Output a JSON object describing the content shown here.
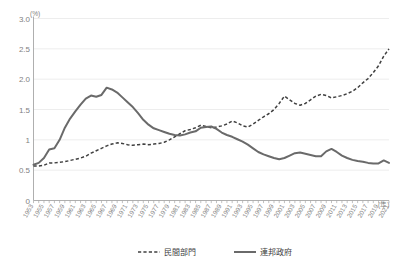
{
  "chart_data": {
    "type": "line",
    "title": "",
    "subtitle": "",
    "xlabel": "(年)",
    "ylabel": "(%)",
    "ylim": [
      0,
      3.0
    ],
    "xlim": [
      1953,
      2021
    ],
    "yticks": [
      "0",
      "0.5",
      "1",
      "1.5",
      "2.0",
      "2.5",
      "3.0"
    ],
    "ytick_values": [
      0,
      0.5,
      1,
      1.5,
      2.0,
      2.5,
      3.0
    ],
    "grid": true,
    "legend_position": "bottom-center",
    "x": [
      1953,
      1954,
      1955,
      1956,
      1957,
      1958,
      1959,
      1960,
      1961,
      1962,
      1963,
      1964,
      1965,
      1966,
      1967,
      1968,
      1969,
      1970,
      1971,
      1972,
      1973,
      1974,
      1975,
      1976,
      1977,
      1978,
      1979,
      1980,
      1981,
      1982,
      1983,
      1984,
      1985,
      1986,
      1987,
      1988,
      1989,
      1990,
      1991,
      1992,
      1993,
      1994,
      1995,
      1996,
      1997,
      1998,
      1999,
      2000,
      2001,
      2002,
      2003,
      2004,
      2005,
      2006,
      2007,
      2008,
      2009,
      2010,
      2011,
      2012,
      2013,
      2014,
      2015,
      2016,
      2017,
      2018,
      2019,
      2020,
      2021
    ],
    "xtick_labels": [
      "1953",
      "1955",
      "1957",
      "1959",
      "1961",
      "1963",
      "1965",
      "1967",
      "1969",
      "1971",
      "1973",
      "1975",
      "1977",
      "1979",
      "1981",
      "1983",
      "1985",
      "1987",
      "1989",
      "1991",
      "1993",
      "1995",
      "1997",
      "1999",
      "2001",
      "2003",
      "2005",
      "2007",
      "2009",
      "2011",
      "2013",
      "2015",
      "2017",
      "2019",
      "2021"
    ],
    "series": [
      {
        "name": "民間部門",
        "style": "dashed",
        "color": "#404040",
        "values": [
          0.57,
          0.57,
          0.58,
          0.62,
          0.62,
          0.63,
          0.64,
          0.66,
          0.68,
          0.7,
          0.73,
          0.78,
          0.82,
          0.86,
          0.9,
          0.93,
          0.95,
          0.94,
          0.92,
          0.91,
          0.92,
          0.93,
          0.92,
          0.93,
          0.94,
          0.96,
          1.0,
          1.05,
          1.1,
          1.15,
          1.17,
          1.2,
          1.24,
          1.22,
          1.2,
          1.21,
          1.23,
          1.26,
          1.31,
          1.28,
          1.23,
          1.21,
          1.26,
          1.32,
          1.38,
          1.43,
          1.5,
          1.6,
          1.72,
          1.66,
          1.6,
          1.57,
          1.6,
          1.66,
          1.72,
          1.75,
          1.73,
          1.69,
          1.71,
          1.73,
          1.76,
          1.8,
          1.86,
          1.94,
          2.01,
          2.11,
          2.22,
          2.38,
          2.5
        ]
      },
      {
        "name": "連邦政府",
        "style": "solid",
        "color": "#6a6a6a",
        "values": [
          0.59,
          0.62,
          0.7,
          0.84,
          0.86,
          1.0,
          1.2,
          1.35,
          1.47,
          1.58,
          1.68,
          1.73,
          1.71,
          1.74,
          1.86,
          1.83,
          1.78,
          1.7,
          1.62,
          1.54,
          1.44,
          1.33,
          1.25,
          1.19,
          1.16,
          1.13,
          1.1,
          1.08,
          1.07,
          1.09,
          1.12,
          1.14,
          1.2,
          1.21,
          1.22,
          1.18,
          1.12,
          1.08,
          1.05,
          1.01,
          0.97,
          0.92,
          0.86,
          0.8,
          0.76,
          0.73,
          0.7,
          0.68,
          0.7,
          0.74,
          0.78,
          0.79,
          0.77,
          0.75,
          0.73,
          0.73,
          0.81,
          0.85,
          0.8,
          0.74,
          0.7,
          0.67,
          0.65,
          0.64,
          0.62,
          0.61,
          0.61,
          0.66,
          0.62
        ]
      }
    ]
  },
  "legend": {
    "items": [
      {
        "label": "民間部門",
        "style": "dashed"
      },
      {
        "label": "連邦政府",
        "style": "solid"
      }
    ]
  },
  "axes": {
    "y_unit": "(%)",
    "x_unit": "(年)"
  },
  "colors": {
    "private_sector": "#404040",
    "federal_government": "#6a6a6a",
    "gridline": "#e8e8e8",
    "axis": "#a6a6a6",
    "tick_label": "#7f7f7f"
  }
}
